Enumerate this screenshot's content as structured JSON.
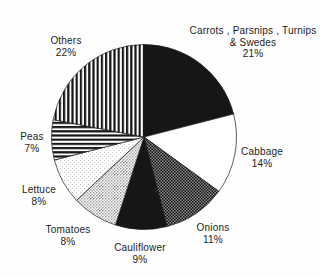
{
  "figure": {
    "background": "#fefefe",
    "ink_color": "#1c1c1c"
  },
  "chart_data": {
    "type": "pie",
    "title": "",
    "unit": "%",
    "start_at": "12-oclock",
    "direction": "clockwise",
    "legend": "none",
    "categories": [
      "Carrots, Parsnips, Turnips & Swedes",
      "Cabbage",
      "Onions",
      "Cauliflower",
      "Tomatoes",
      "Lettuce",
      "Peas",
      "Others"
    ],
    "values": [
      21,
      14,
      11,
      9,
      8,
      8,
      7,
      22
    ],
    "label_line_height": 11.5,
    "slices": [
      {
        "id": "carrots-parsnips-turnips-swedes",
        "percent": 21,
        "pattern": "solid-black",
        "label_lines": [
          "Carrots , Parsnips , Turnips",
          "& Swedes",
          "21%"
        ],
        "label_x": 253,
        "label_y": 34
      },
      {
        "id": "cabbage",
        "percent": 14,
        "pattern": "white",
        "label_lines": [
          "Cabbage",
          "14%"
        ],
        "label_x": 262,
        "label_y": 155
      },
      {
        "id": "onions",
        "percent": 11,
        "pattern": "dark-dither",
        "label_lines": [
          "Onions",
          "11%"
        ],
        "label_x": 213,
        "label_y": 231
      },
      {
        "id": "cauliflower",
        "percent": 9,
        "pattern": "solid-black",
        "label_lines": [
          "Cauliflower",
          "9%"
        ],
        "label_x": 140,
        "label_y": 251
      },
      {
        "id": "tomatoes",
        "percent": 8,
        "pattern": "light-dither",
        "label_lines": [
          "Tomatoes",
          "8%"
        ],
        "label_x": 68,
        "label_y": 233
      },
      {
        "id": "lettuce",
        "percent": 8,
        "pattern": "faint-dither",
        "label_lines": [
          "Lettuce",
          "8%"
        ],
        "label_x": 39,
        "label_y": 193
      },
      {
        "id": "peas",
        "percent": 7,
        "pattern": "h-stripes",
        "label_lines": [
          "Peas",
          "7%"
        ],
        "label_x": 32,
        "label_y": 140
      },
      {
        "id": "others",
        "percent": 22,
        "pattern": "v-stripes",
        "label_lines": [
          "Others",
          "22%"
        ],
        "label_x": 66,
        "label_y": 44
      }
    ],
    "pattern_colors": {
      "ink": "#161616",
      "paper": "#ffffff",
      "dark_dither_base": "#8a8a8a",
      "light_dither_dot": "#9a9a9a",
      "faint_dither_dot": "#c8c8c8"
    }
  }
}
